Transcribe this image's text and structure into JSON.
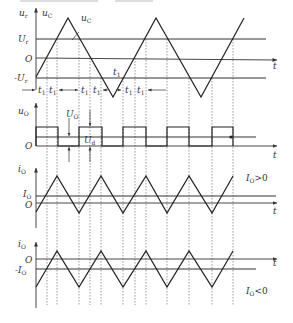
{
  "figure": {
    "panels": [
      {
        "id": "carrier-comparison",
        "y_axis_labels": [
          "u_r",
          "u_C"
        ],
        "levels": [
          "U_r",
          "O",
          "-U_r"
        ],
        "curve_labels": [
          "u_C",
          "u_C"
        ],
        "time_labels": [
          "t_1",
          "t_1",
          "t_1",
          "t_1",
          "t_1",
          "t_1",
          "t_1",
          "t_1"
        ],
        "x_axis_label": "t"
      },
      {
        "id": "output-voltage",
        "y_axis_label": "u_O",
        "level_labels": [
          "U_O",
          "U_d"
        ],
        "baseline_label": "O",
        "x_axis_label": "t"
      },
      {
        "id": "output-current-positive",
        "y_axis_label": "i_O",
        "levels": [
          "I_O",
          "O"
        ],
        "condition": "I_O>0",
        "x_axis_label": "t"
      },
      {
        "id": "output-current-negative",
        "y_axis_label": "i_O",
        "levels": [
          "O",
          "-I_O"
        ],
        "condition": "I_O<0",
        "x_axis_label": "t"
      }
    ]
  },
  "text": {
    "ur": "u",
    "ur_sub": "r",
    "uc_axis": "u",
    "uc_axis_sub": "C",
    "uc_curve1": "u",
    "uc_curve1_sub": "C",
    "Ur": "U",
    "Ur_sub": "r",
    "O": "O",
    "negUr": "-U",
    "negUr_sub": "r",
    "t": "t",
    "t1": "t",
    "t1_sub": "1",
    "uo": "u",
    "uo_sub": "O",
    "Uo": "U",
    "Uo_sub": "O",
    "Ud": "U",
    "Ud_sub": "d",
    "io": "i",
    "io_sub": "O",
    "Io": "I",
    "Io_sub": "O",
    "negIo": "-I",
    "cond_pos": "I",
    "cond_pos_rest": ">0",
    "cond_neg": "I",
    "cond_neg_rest": "<0"
  }
}
